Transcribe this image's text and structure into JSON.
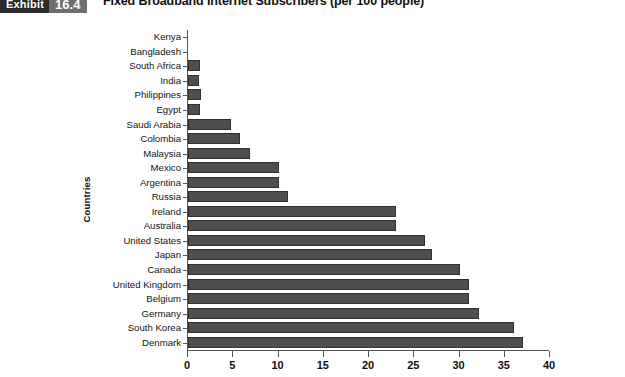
{
  "exhibit": {
    "word": "Exhibit",
    "number": "16.4"
  },
  "chart_data": {
    "type": "bar",
    "orientation": "horizontal",
    "title": "Fixed Broadband Internet Subscribers (per 100 people)",
    "xlabel": "",
    "ylabel": "Countries",
    "xlim": [
      0,
      40
    ],
    "xticks": [
      0,
      5,
      10,
      15,
      20,
      25,
      30,
      35,
      40
    ],
    "grid": false,
    "legend": null,
    "bar_color": "#4f4f4f",
    "bar_edge_color": "#303030",
    "categories": [
      "Kenya",
      "Bangladesh",
      "South Africa",
      "India",
      "Philippines",
      "Egypt",
      "Saudi Arabia",
      "Colombia",
      "Malaysia",
      "Mexico",
      "Argentina",
      "Russia",
      "Ireland",
      "Australia",
      "United States",
      "Japan",
      "Canada",
      "United Kingdom",
      "Belgium",
      "Germany",
      "South Korea",
      "Denmark"
    ],
    "values": [
      0.1,
      0.2,
      1.3,
      1.2,
      1.4,
      1.3,
      4.7,
      5.8,
      6.8,
      10.0,
      10.0,
      11.1,
      23.0,
      23.0,
      26.2,
      27.0,
      30.1,
      31.0,
      31.0,
      32.2,
      36.0,
      37.0
    ]
  }
}
